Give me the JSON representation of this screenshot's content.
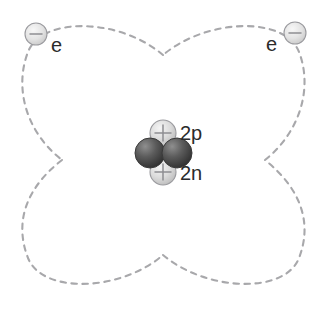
{
  "figure": {
    "name": "helium-atom-model",
    "background_color": "#ffffff",
    "width": 326,
    "height": 310
  },
  "nucleus": {
    "protons": {
      "label": "2p",
      "count": 2,
      "sign": "+",
      "color": "#d9d9d9",
      "positions": [
        {
          "cx": 163,
          "cy": 133,
          "r": 13
        },
        {
          "cx": 163,
          "cy": 172,
          "r": 13
        }
      ]
    },
    "neutrons": {
      "label": "2n",
      "count": 2,
      "sign": "",
      "color": "#4a4a4a",
      "positions": [
        {
          "cx": 150,
          "cy": 153,
          "r": 15
        },
        {
          "cx": 177,
          "cy": 153,
          "r": 15
        }
      ]
    }
  },
  "electrons": [
    {
      "id": "electron-left",
      "label": "e",
      "sign": "−",
      "color": "#e0e0e0",
      "cx": 36,
      "cy": 34,
      "r": 11,
      "label_x": 51,
      "label_y": 52
    },
    {
      "id": "electron-right",
      "label": "e",
      "sign": "−",
      "color": "#e0e0e0",
      "cx": 295,
      "cy": 33,
      "r": 11,
      "label_x": 277,
      "label_y": 51
    }
  ],
  "orbitals": {
    "stroke_color": "#a8a8ab",
    "style": "dashed",
    "count": 4,
    "crossings": [
      {
        "name": "top",
        "x": 163,
        "y": 55
      },
      {
        "name": "right",
        "x": 265,
        "y": 160
      },
      {
        "name": "bottom",
        "x": 163,
        "y": 255
      },
      {
        "name": "left",
        "x": 62,
        "y": 160
      }
    ],
    "paths": [
      "M163,55 C120,18 42,16 28,52 C14,88 26,132 62,160",
      "M265,160 C300,132 313,88 299,52 C285,16 207,18 163,55",
      "M163,255 C207,292 285,294 299,258 C313,222 300,188 265,160",
      "M62,160 C26,188 14,222 28,258 C42,294 120,292 163,255"
    ]
  }
}
